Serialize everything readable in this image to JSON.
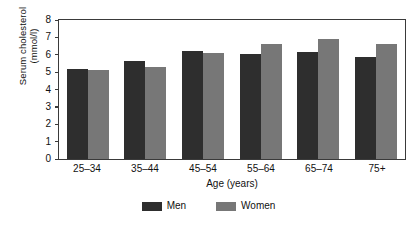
{
  "chart_data": {
    "type": "bar",
    "title": "",
    "xlabel": "Age (years)",
    "ylabel": "Serum cholesterol (mmol/l)",
    "ylabel_line1": "Serum cholesterol",
    "ylabel_line2": "(mmol/l)",
    "categories": [
      "25–34",
      "35–44",
      "45–54",
      "55–64",
      "65–74",
      "75+"
    ],
    "series": [
      {
        "name": "Men",
        "color": "#2e2e2e",
        "values": [
          5.2,
          5.65,
          6.2,
          6.05,
          6.15,
          5.9
        ]
      },
      {
        "name": "Women",
        "color": "#777777",
        "values": [
          5.1,
          5.3,
          6.1,
          6.6,
          6.9,
          6.6
        ]
      }
    ],
    "ylim": [
      0,
      8
    ],
    "yticks": [
      0,
      1,
      2,
      3,
      4,
      5,
      6,
      7,
      8
    ],
    "ytick_labels": [
      "0",
      "1",
      "2",
      "3",
      "4",
      "5",
      "6",
      "7",
      "8"
    ],
    "grid": false,
    "legend_position": "bottom-center",
    "legend": [
      "Men",
      "Women"
    ]
  }
}
